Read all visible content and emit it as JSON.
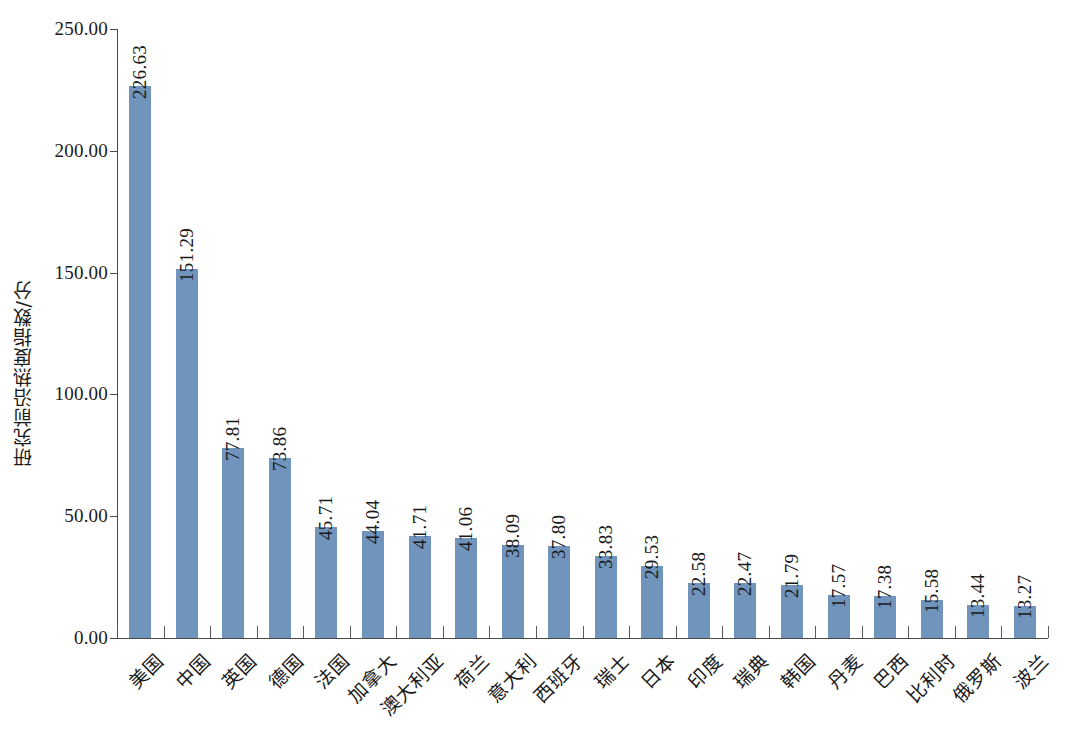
{
  "chart_data": {
    "type": "bar",
    "title": "",
    "xlabel": "",
    "ylabel": "研究前沿热度指数/分",
    "ylim": [
      0,
      250
    ],
    "ytick_step": 50,
    "ytick_labels": [
      "0.00",
      "50.00",
      "100.00",
      "150.00",
      "200.00",
      "250.00"
    ],
    "ytick_values": [
      0,
      50,
      100,
      150,
      200,
      250
    ],
    "grid": false,
    "legend": false,
    "bar_color": "#7094bb",
    "axis_color": "#4a4a4a",
    "value_label_format": "two-decimals",
    "value_label_rotation": "vertical",
    "xtick_label_rotation": "45deg",
    "categories": [
      "美国",
      "中国",
      "英国",
      "德国",
      "法国",
      "加拿大",
      "澳大利亚",
      "荷兰",
      "意大利",
      "西班牙",
      "瑞士",
      "日本",
      "印度",
      "瑞典",
      "韩国",
      "丹麦",
      "巴西",
      "比利时",
      "俄罗斯",
      "波兰"
    ],
    "values": [
      226.63,
      151.29,
      77.81,
      73.86,
      45.71,
      44.04,
      41.71,
      41.06,
      38.09,
      37.8,
      33.83,
      29.53,
      22.58,
      22.47,
      21.79,
      17.57,
      17.38,
      15.58,
      13.44,
      13.27
    ],
    "value_labels": [
      "226.63",
      "151.29",
      "77.81",
      "73.86",
      "45.71",
      "44.04",
      "41.71",
      "41.06",
      "38.09",
      "37.80",
      "33.83",
      "29.53",
      "22.58",
      "22.47",
      "21.79",
      "17.57",
      "17.38",
      "15.58",
      "13.44",
      "13.27"
    ]
  }
}
